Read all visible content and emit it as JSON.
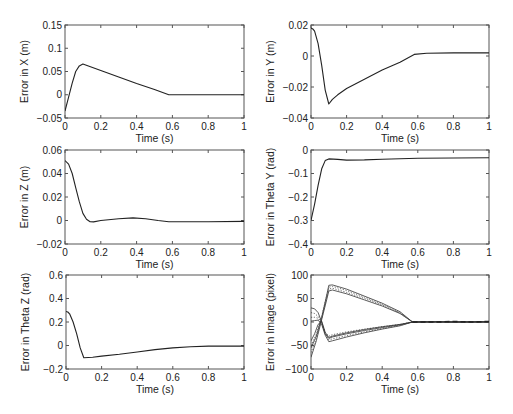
{
  "figure": {
    "layout": "3x2 grid of line subplots",
    "xlabel_common": "Time (s)"
  },
  "chart_data": [
    {
      "id": "x",
      "type": "line",
      "box": [
        65,
        25,
        244,
        118
      ],
      "xlabel": "Time (s)",
      "ylabel": "Error in X (m)",
      "xlim": [
        0,
        1
      ],
      "ylim": [
        -0.05,
        0.15
      ],
      "xticks": [
        0,
        0.2,
        0.4,
        0.6,
        0.8,
        1
      ],
      "xtick_labels": [
        "0",
        "0.2",
        "0.4",
        "0.6",
        "0.8",
        "1"
      ],
      "yticks": [
        -0.05,
        0,
        0.05,
        0.1,
        0.15
      ],
      "ytick_labels": [
        "−0.05",
        "0",
        "0.05",
        "0.1",
        "0.15"
      ],
      "series": [
        {
          "name": "error_x",
          "style": "solid",
          "x": [
            0,
            0.02,
            0.04,
            0.06,
            0.08,
            0.1,
            0.2,
            0.3,
            0.4,
            0.5,
            0.58,
            0.7,
            0.8,
            0.9,
            1.0
          ],
          "y": [
            -0.035,
            -0.005,
            0.025,
            0.05,
            0.062,
            0.066,
            0.052,
            0.038,
            0.024,
            0.011,
            0.0,
            0.0,
            0.0,
            0.0,
            0.0
          ]
        }
      ]
    },
    {
      "id": "y",
      "type": "line",
      "box": [
        311,
        25,
        489,
        118
      ],
      "xlabel": "Time (s)",
      "ylabel": "Error in Y (m)",
      "xlim": [
        0,
        1
      ],
      "ylim": [
        -0.04,
        0.02
      ],
      "xticks": [
        0,
        0.2,
        0.4,
        0.6,
        0.8,
        1
      ],
      "xtick_labels": [
        "0",
        "0.2",
        "0.4",
        "0.6",
        "0.8",
        "1"
      ],
      "yticks": [
        -0.04,
        -0.02,
        0,
        0.02
      ],
      "ytick_labels": [
        "−0.04",
        "−0.02",
        "0",
        "0.02"
      ],
      "series": [
        {
          "name": "error_y",
          "style": "solid",
          "x": [
            0,
            0.01,
            0.02,
            0.04,
            0.06,
            0.08,
            0.1,
            0.12,
            0.15,
            0.2,
            0.3,
            0.4,
            0.5,
            0.58,
            0.65,
            0.8,
            1.0
          ],
          "y": [
            0.018,
            0.0175,
            0.016,
            0.008,
            -0.006,
            -0.022,
            -0.031,
            -0.028,
            -0.025,
            -0.021,
            -0.015,
            -0.009,
            -0.004,
            0.001,
            0.0018,
            0.002,
            0.002
          ]
        }
      ]
    },
    {
      "id": "z",
      "type": "line",
      "box": [
        65,
        150,
        244,
        244
      ],
      "xlabel": "Time (s)",
      "ylabel": "Error in Z (m)",
      "xlim": [
        0,
        1
      ],
      "ylim": [
        -0.02,
        0.06
      ],
      "xticks": [
        0,
        0.2,
        0.4,
        0.6,
        0.8,
        1
      ],
      "xtick_labels": [
        "0",
        "0.2",
        "0.4",
        "0.6",
        "0.8",
        "1"
      ],
      "yticks": [
        -0.02,
        0,
        0.02,
        0.04,
        0.06
      ],
      "ytick_labels": [
        "−0.02",
        "0",
        "0.02",
        "0.04",
        "0.06"
      ],
      "series": [
        {
          "name": "error_z",
          "style": "solid",
          "x": [
            0,
            0.02,
            0.04,
            0.06,
            0.08,
            0.1,
            0.12,
            0.14,
            0.16,
            0.2,
            0.3,
            0.38,
            0.45,
            0.52,
            0.58,
            0.7,
            0.8,
            1.0
          ],
          "y": [
            0.051,
            0.048,
            0.04,
            0.028,
            0.016,
            0.006,
            0.001,
            -0.001,
            -0.0012,
            0.0,
            0.0015,
            0.0022,
            0.0015,
            0.0,
            -0.001,
            -0.001,
            -0.001,
            -0.0008
          ]
        }
      ]
    },
    {
      "id": "theta_y",
      "type": "line",
      "box": [
        311,
        150,
        489,
        244
      ],
      "xlabel": "Time (s)",
      "ylabel": "Error in Theta Y (rad)",
      "xlim": [
        0,
        1
      ],
      "ylim": [
        -0.4,
        0
      ],
      "xticks": [
        0,
        0.2,
        0.4,
        0.6,
        0.8,
        1
      ],
      "xtick_labels": [
        "0",
        "0.2",
        "0.4",
        "0.6",
        "0.8",
        "1"
      ],
      "yticks": [
        -0.4,
        -0.3,
        -0.2,
        -0.1,
        0
      ],
      "ytick_labels": [
        "−0.4",
        "−0.3",
        "−0.2",
        "−0.1",
        "0"
      ],
      "series": [
        {
          "name": "error_theta_y",
          "style": "solid",
          "x": [
            0,
            0.02,
            0.04,
            0.06,
            0.08,
            0.1,
            0.15,
            0.2,
            0.3,
            0.4,
            0.6,
            0.8,
            1.0
          ],
          "y": [
            -0.3,
            -0.23,
            -0.15,
            -0.08,
            -0.045,
            -0.038,
            -0.04,
            -0.043,
            -0.042,
            -0.039,
            -0.035,
            -0.034,
            -0.033
          ]
        }
      ]
    },
    {
      "id": "theta_z",
      "type": "line",
      "box": [
        66,
        275,
        244,
        369
      ],
      "xlabel": "Time (s)",
      "ylabel": "Error in Theta Z (rad)",
      "xlim": [
        0,
        1
      ],
      "ylim": [
        -0.2,
        0.6
      ],
      "xticks": [
        0,
        0.2,
        0.4,
        0.6,
        0.8,
        1
      ],
      "xtick_labels": [
        "0",
        "0.2",
        "0.4",
        "0.6",
        "0.8",
        "1"
      ],
      "yticks": [
        -0.2,
        0,
        0.2,
        0.4,
        0.6
      ],
      "ytick_labels": [
        "−0.2",
        "0",
        "0.2",
        "0.4",
        "0.6"
      ],
      "series": [
        {
          "name": "error_theta_z",
          "style": "solid",
          "x": [
            0,
            0.01,
            0.02,
            0.04,
            0.06,
            0.08,
            0.1,
            0.15,
            0.2,
            0.3,
            0.4,
            0.5,
            0.6,
            0.7,
            0.8,
            1.0
          ],
          "y": [
            0.29,
            0.285,
            0.27,
            0.2,
            0.1,
            -0.02,
            -0.105,
            -0.1,
            -0.09,
            -0.075,
            -0.055,
            -0.035,
            -0.02,
            -0.01,
            -0.005,
            -0.005
          ]
        }
      ]
    },
    {
      "id": "image",
      "type": "line",
      "box": [
        311,
        275,
        489,
        369
      ],
      "xlabel": "Time (s)",
      "ylabel": "Error in Image (pixel)",
      "xlim": [
        0,
        1
      ],
      "ylim": [
        -100,
        100
      ],
      "xticks": [
        0,
        0.2,
        0.4,
        0.6,
        0.8,
        1
      ],
      "xtick_labels": [
        "0",
        "0.2",
        "0.4",
        "0.6",
        "0.8",
        "1"
      ],
      "yticks": [
        -100,
        -50,
        0,
        50,
        100
      ],
      "ytick_labels": [
        "−100",
        "−50",
        "0",
        "50",
        "100"
      ],
      "series": [
        {
          "name": "u1",
          "style": "solid",
          "x": [
            0,
            0.03,
            0.06,
            0.09,
            0.1,
            0.12,
            0.2,
            0.3,
            0.4,
            0.5,
            0.57,
            0.7,
            0.8,
            1.0
          ],
          "y": [
            -55,
            -30,
            10,
            60,
            78,
            79,
            70,
            55,
            40,
            22,
            0,
            1,
            0,
            1
          ]
        },
        {
          "name": "u2",
          "style": "dot",
          "x": [
            0,
            0.03,
            0.06,
            0.09,
            0.1,
            0.12,
            0.2,
            0.3,
            0.4,
            0.5,
            0.57,
            0.7,
            0.8,
            1.0
          ],
          "y": [
            -50,
            -26,
            12,
            58,
            74,
            76,
            67,
            53,
            38,
            20,
            0,
            1,
            0,
            1
          ]
        },
        {
          "name": "u3",
          "style": "solid",
          "x": [
            0,
            0.03,
            0.06,
            0.09,
            0.1,
            0.12,
            0.2,
            0.3,
            0.4,
            0.5,
            0.57,
            0.7,
            0.8,
            1.0
          ],
          "y": [
            -75,
            -40,
            5,
            50,
            66,
            68,
            60,
            47,
            34,
            18,
            0,
            0,
            0,
            0
          ]
        },
        {
          "name": "u4",
          "style": "dot",
          "x": [
            0,
            0.03,
            0.06,
            0.09,
            0.1,
            0.12,
            0.2,
            0.3,
            0.4,
            0.5,
            0.57,
            0.7,
            0.8,
            1.0
          ],
          "y": [
            -65,
            -35,
            8,
            54,
            70,
            72,
            63,
            50,
            36,
            19,
            0,
            1,
            0,
            1
          ]
        },
        {
          "name": "v1",
          "style": "solid",
          "x": [
            0,
            0.02,
            0.04,
            0.06,
            0.08,
            0.1,
            0.12,
            0.2,
            0.3,
            0.4,
            0.5,
            0.57,
            0.7,
            0.8,
            1.0
          ],
          "y": [
            30,
            28,
            20,
            0,
            -25,
            -35,
            -32,
            -25,
            -18,
            -12,
            -6,
            0,
            0,
            0,
            0
          ]
        },
        {
          "name": "v2",
          "style": "dot",
          "x": [
            0,
            0.02,
            0.04,
            0.06,
            0.08,
            0.1,
            0.12,
            0.2,
            0.3,
            0.4,
            0.5,
            0.57,
            0.7,
            0.8,
            1.0
          ],
          "y": [
            20,
            18,
            12,
            -2,
            -22,
            -30,
            -27,
            -21,
            -15,
            -10,
            -5,
            0,
            0,
            0,
            0
          ]
        },
        {
          "name": "v3",
          "style": "solid",
          "x": [
            0,
            0.02,
            0.04,
            0.06,
            0.08,
            0.1,
            0.12,
            0.2,
            0.3,
            0.4,
            0.5,
            0.57,
            0.7,
            0.8,
            1.0
          ],
          "y": [
            2,
            3,
            4,
            -5,
            -28,
            -42,
            -40,
            -32,
            -23,
            -15,
            -8,
            0,
            0,
            0,
            0
          ]
        },
        {
          "name": "v4",
          "style": "dot",
          "x": [
            0,
            0.02,
            0.04,
            0.06,
            0.08,
            0.1,
            0.12,
            0.2,
            0.3,
            0.4,
            0.5,
            0.57,
            0.7,
            0.8,
            1.0
          ],
          "y": [
            10,
            10,
            8,
            -3,
            -26,
            -38,
            -36,
            -29,
            -21,
            -14,
            -7,
            0,
            0,
            0,
            0
          ]
        },
        {
          "name": "v5",
          "style": "solid",
          "x": [
            0,
            0.02,
            0.04,
            0.06,
            0.08,
            0.1,
            0.12,
            0.2,
            0.3,
            0.4,
            0.5,
            0.57
          ],
          "y": [
            -40,
            -25,
            -5,
            2,
            -22,
            -33,
            -30,
            -23,
            -16,
            -10,
            -5,
            0
          ]
        },
        {
          "name": "tail_dash",
          "style": "dash",
          "x": [
            0.57,
            0.7,
            0.8,
            0.9,
            1.0
          ],
          "y": [
            0,
            0,
            1,
            0,
            1
          ]
        }
      ]
    }
  ]
}
